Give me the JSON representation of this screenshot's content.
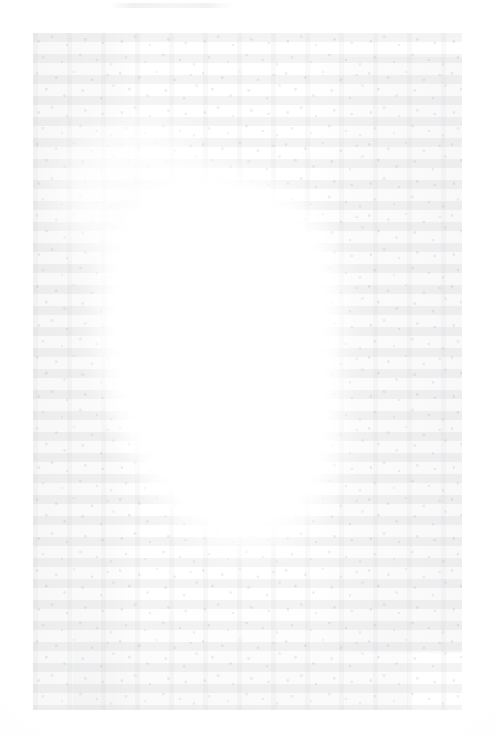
{
  "document": {
    "kind": "scanned-page",
    "condition": "severely faded / washed out",
    "legible_text": null,
    "note": "No characters are legible at any magnification; the page shows only faint grey ink residue and scanner grain.",
    "page": {
      "width_px": 497,
      "height_px": 742,
      "background_color": "#fefefe"
    },
    "content_block": {
      "left_px": 33,
      "top_px": 33,
      "width_px": 429,
      "height_px": 677,
      "residue_color": "#787c84"
    },
    "running_header": {
      "left_px": 110,
      "top_px": 3,
      "width_px": 122,
      "legible_text": null
    },
    "bleached_void": {
      "description": "large irregular white region through the centre-left where the ink has been lost entirely",
      "left_px": 97,
      "top_px": 167,
      "width_px": 245,
      "height_px": 355
    }
  }
}
